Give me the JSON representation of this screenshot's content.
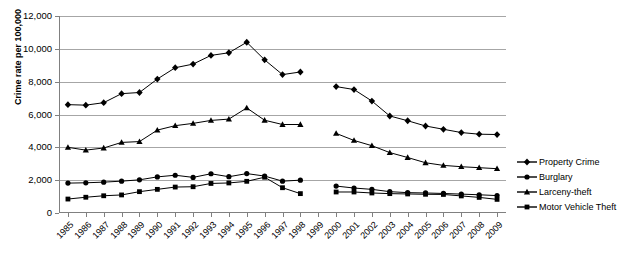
{
  "chart_data": {
    "type": "line",
    "title": "",
    "xlabel": "",
    "ylabel": "Crime rate per 100,000",
    "ylim": [
      0,
      12000
    ],
    "ytick_labels": [
      "0",
      "2,000",
      "4,000",
      "6,000",
      "8,000",
      "10,000",
      "12,000"
    ],
    "ytick_values": [
      0,
      2000,
      4000,
      6000,
      8000,
      10000,
      12000
    ],
    "grid": true,
    "legend_position": "right",
    "x": [
      1985,
      1986,
      1987,
      1988,
      1989,
      1990,
      1991,
      1992,
      1993,
      1994,
      1995,
      1996,
      1997,
      1998,
      1999,
      2000,
      2001,
      2002,
      2003,
      2004,
      2005,
      2006,
      2007,
      2008,
      2009
    ],
    "categories": [
      "1985",
      "1986",
      "1987",
      "1988",
      "1989",
      "1990",
      "1991",
      "1992",
      "1993",
      "1994",
      "1995",
      "1996",
      "1997",
      "1998",
      "1999",
      "2000",
      "2001",
      "2002",
      "2003",
      "2004",
      "2005",
      "2006",
      "2007",
      "2008",
      "2009"
    ],
    "note": "All four series have a data gap at 1999 (no values plotted).",
    "series": [
      {
        "name": "Property Crime",
        "marker": "diamond",
        "values": [
          6600,
          6570,
          6720,
          7270,
          7340,
          8160,
          8850,
          9070,
          9600,
          9760,
          10400,
          9330,
          8430,
          8590,
          null,
          7700,
          7520,
          6820,
          5910,
          5620,
          5300,
          5100,
          4900,
          4800,
          4780
        ]
      },
      {
        "name": "Burglary",
        "marker": "circle",
        "values": [
          1820,
          1840,
          1880,
          1940,
          2020,
          2200,
          2300,
          2170,
          2390,
          2210,
          2400,
          2250,
          1940,
          2000,
          null,
          1640,
          1520,
          1440,
          1300,
          1240,
          1220,
          1190,
          1150,
          1110,
          1060
        ]
      },
      {
        "name": "Larceny-theft",
        "marker": "triangle",
        "values": [
          4000,
          3830,
          3960,
          4300,
          4350,
          5050,
          5320,
          5460,
          5640,
          5720,
          6400,
          5650,
          5390,
          5390,
          null,
          4850,
          4420,
          4100,
          3680,
          3380,
          3060,
          2900,
          2820,
          2760,
          2700
        ]
      },
      {
        "name": "Motor Vehicle Theft",
        "marker": "square",
        "values": [
          850,
          960,
          1050,
          1100,
          1300,
          1440,
          1580,
          1600,
          1800,
          1830,
          1930,
          2180,
          1540,
          1180,
          null,
          1280,
          1280,
          1220,
          1180,
          1160,
          1140,
          1130,
          1040,
          950,
          830
        ]
      }
    ]
  },
  "legend": {
    "items": [
      {
        "label": "Property Crime",
        "marker": "diamond"
      },
      {
        "label": "Burglary",
        "marker": "circle"
      },
      {
        "label": "Larceny-theft",
        "marker": "triangle"
      },
      {
        "label": "Motor Vehicle Theft",
        "marker": "square"
      }
    ]
  },
  "colors": {
    "series": "#000000",
    "gridline": "#a6a6a6",
    "axis": "#808080",
    "background": "#ffffff"
  }
}
